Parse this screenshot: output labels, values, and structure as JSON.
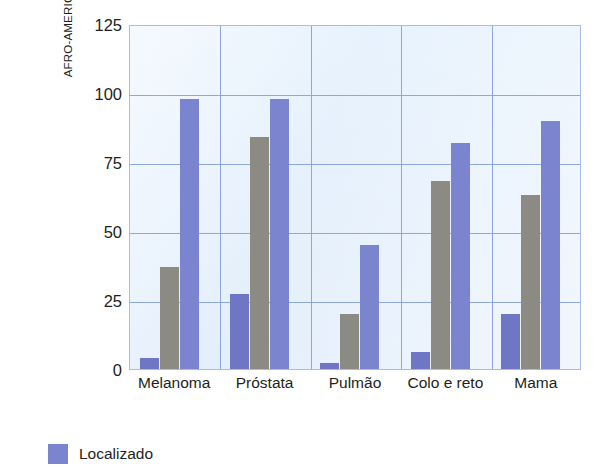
{
  "chart_data": {
    "type": "bar",
    "title": "",
    "subtitle": "",
    "xlabel": "",
    "ylabel_line1": "TAXA DE SOBREVIVÊNCIA DE",
    "ylabel_line2": "AFRO-AMERICANOS (POR 100 MIL)",
    "categories": [
      "Melanoma",
      "Próstata",
      "Pulmão",
      "Colo e reto",
      "Mama"
    ],
    "series": [
      {
        "name": "Localizado",
        "color": "#6f77c4",
        "values": [
          4,
          27,
          2,
          6,
          20
        ]
      },
      {
        "name": "Regional",
        "color": "#8c8b83",
        "values": [
          37,
          84,
          20,
          68,
          63
        ]
      },
      {
        "name": "Distante",
        "color": "#7b84ce",
        "values": [
          98,
          98,
          45,
          82,
          90
        ]
      }
    ],
    "yticks": [
      0,
      25,
      50,
      75,
      100,
      125
    ],
    "ytick_labels": [
      "0",
      "25",
      "50",
      "75",
      "100",
      "125"
    ],
    "ylim": [
      0,
      125
    ],
    "grid": true,
    "grid_color": "#8fa8db",
    "plot_background": "#e8f2fc",
    "legend_position": "bottom-left",
    "legend_visible_entries": [
      "Localizado"
    ]
  },
  "legend": {
    "localizado_label": "Localizado"
  }
}
